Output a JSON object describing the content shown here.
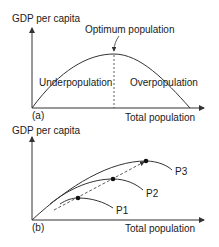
{
  "panel_a": {
    "tag": "(a)",
    "ylabel": "GDP per capita",
    "xlabel": "Total population",
    "optimum_label": "Optimum population",
    "left_region": "Underpopulation",
    "right_region": "Overpopulation"
  },
  "panel_b": {
    "tag": "(b)",
    "ylabel": "GDP per capita",
    "xlabel": "Total population",
    "curves": [
      {
        "label": "P1"
      },
      {
        "label": "P2"
      },
      {
        "label": "P3"
      }
    ]
  },
  "colors": {
    "line": "#333333",
    "text": "#1a1a1a"
  }
}
